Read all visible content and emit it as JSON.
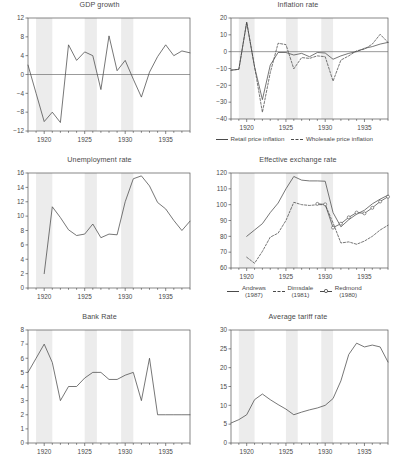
{
  "figure": {
    "width": 397,
    "height": 467,
    "background": "#ffffff",
    "band_color": "#ececec",
    "line_color": "#4a4a4a"
  },
  "chart_data": [
    {
      "id": "gdp-growth",
      "type": "line",
      "title": "GDP growth",
      "xlabel": "",
      "ylabel": "",
      "xlim": [
        1918,
        1938
      ],
      "ylim": [
        -12,
        12
      ],
      "yticks": [
        -12,
        -8,
        -4,
        0,
        4,
        8,
        12
      ],
      "xticks": [
        1920,
        1925,
        1930,
        1935
      ],
      "grid": false,
      "zero_line": true,
      "shaded_bands": [
        [
          1919,
          1921
        ],
        [
          1925,
          1926.5
        ],
        [
          1929.5,
          1931
        ]
      ],
      "x": [
        1918,
        1919,
        1920,
        1921,
        1922,
        1923,
        1924,
        1925,
        1926,
        1927,
        1928,
        1929,
        1930,
        1931,
        1932,
        1933,
        1934,
        1935,
        1936,
        1937,
        1938
      ],
      "series": [
        {
          "name": "GDP growth",
          "style": "solid",
          "values": [
            2.0,
            -4.0,
            -10.0,
            -8.0,
            -10.2,
            6.3,
            3.0,
            4.8,
            4.0,
            -3.2,
            8.2,
            0.8,
            3.0,
            -1.0,
            -4.8,
            0.5,
            3.8,
            6.3,
            4.0,
            5.0,
            4.6,
            1.0
          ]
        }
      ]
    },
    {
      "id": "inflation-rate",
      "type": "line",
      "title": "Inflation rate",
      "xlabel": "",
      "ylabel": "",
      "xlim": [
        1918,
        1938
      ],
      "ylim": [
        -40,
        20
      ],
      "yticks": [
        -40,
        -30,
        -20,
        -10,
        0,
        10,
        20
      ],
      "xticks": [
        1920,
        1925,
        1930,
        1935
      ],
      "grid": false,
      "zero_line": true,
      "shaded_bands": [
        [
          1919,
          1921
        ],
        [
          1925,
          1926.5
        ],
        [
          1929.5,
          1931
        ]
      ],
      "legend_position": "below",
      "x": [
        1918,
        1919,
        1920,
        1921,
        1922,
        1923,
        1924,
        1925,
        1926,
        1927,
        1928,
        1929,
        1930,
        1931,
        1932,
        1933,
        1934,
        1935,
        1936,
        1937,
        1938
      ],
      "series": [
        {
          "name": "Retail price inflation",
          "style": "solid",
          "values": [
            -11.0,
            -10.5,
            17.5,
            -9.0,
            -28.5,
            -8.0,
            -0.5,
            -0.5,
            -2.0,
            -1.0,
            -3.0,
            -0.5,
            -0.8,
            -4.5,
            -2.5,
            -1.0,
            0.0,
            2.0,
            3.0,
            4.5,
            5.5,
            -1.5
          ]
        },
        {
          "name": "Wholesale price inflation",
          "style": "dashed",
          "values": [
            -11.0,
            -10.5,
            17.5,
            -9.0,
            -36.0,
            -12.5,
            5.0,
            4.2,
            -10.2,
            -3.5,
            -4.0,
            -2.5,
            -3.0,
            -17.5,
            -5.0,
            -2.5,
            0.5,
            1.5,
            4.5,
            10.3,
            5.5,
            -8.0
          ]
        }
      ]
    },
    {
      "id": "unemployment-rate",
      "type": "line",
      "title": "Unemployment rate",
      "xlabel": "",
      "ylabel": "",
      "xlim": [
        1918,
        1938
      ],
      "ylim": [
        0,
        16
      ],
      "yticks": [
        0,
        2,
        4,
        6,
        8,
        10,
        12,
        14,
        16
      ],
      "xticks": [
        1920,
        1925,
        1930,
        1935
      ],
      "grid": false,
      "zero_line": false,
      "shaded_bands": [
        [
          1919,
          1921
        ],
        [
          1925,
          1926.5
        ],
        [
          1929.5,
          1931
        ]
      ],
      "x": [
        1920,
        1921,
        1922,
        1923,
        1924,
        1925,
        1926,
        1927,
        1928,
        1929,
        1930,
        1931,
        1932,
        1933,
        1934,
        1935,
        1936,
        1937,
        1938
      ],
      "series": [
        {
          "name": "Unemployment rate",
          "style": "solid",
          "values": [
            2.0,
            11.3,
            9.8,
            8.1,
            7.3,
            7.5,
            8.9,
            7.0,
            7.5,
            7.4,
            12.0,
            15.2,
            15.6,
            14.2,
            11.9,
            11.0,
            9.4,
            8.0,
            9.3
          ]
        }
      ]
    },
    {
      "id": "effective-exchange-rate",
      "type": "line",
      "title": "Effective exchange rate",
      "xlabel": "",
      "ylabel": "",
      "xlim": [
        1918,
        1938
      ],
      "ylim": [
        60,
        120
      ],
      "yticks": [
        60,
        70,
        80,
        90,
        100,
        110,
        120
      ],
      "xticks": [
        1920,
        1925,
        1930,
        1935
      ],
      "grid": false,
      "zero_line": false,
      "shaded_bands": [
        [
          1919,
          1921
        ],
        [
          1925,
          1926.5
        ],
        [
          1929.5,
          1931
        ]
      ],
      "legend_position": "below",
      "x": [
        1920,
        1921,
        1922,
        1923,
        1924,
        1925,
        1926,
        1927,
        1928,
        1929,
        1930,
        1931,
        1932,
        1933,
        1934,
        1935,
        1936,
        1937,
        1938
      ],
      "series": [
        {
          "name": "Andrews (1987)",
          "legend_label": "Andrews",
          "legend_sub": "(1987)",
          "style": "solid",
          "values": [
            80.0,
            84.0,
            88.0,
            95.0,
            101.0,
            110.0,
            117.8,
            115.5,
            115.0,
            115.0,
            114.8,
            95.0,
            86.0,
            90.5,
            94.0,
            96.5,
            100.5,
            103.5,
            106.0
          ]
        },
        {
          "name": "Dimsdale (1981)",
          "legend_label": "Dimsdale",
          "legend_sub": "(1981)",
          "style": "dashed",
          "values": [
            66.8,
            63.0,
            70.5,
            79.5,
            82.0,
            90.0,
            101.5,
            100.0,
            99.5,
            100.0,
            100.0,
            88.5,
            75.8,
            76.5,
            75.0,
            77.0,
            80.0,
            84.0,
            87.0
          ]
        },
        {
          "name": "Redmond (1980)",
          "legend_label": "Redmond",
          "legend_sub": "(1980)",
          "style": "solid-marker",
          "values": [
            null,
            null,
            null,
            null,
            null,
            null,
            null,
            null,
            null,
            100.5,
            100.2,
            85.5,
            88.0,
            92.0,
            95.0,
            94.5,
            98.0,
            102.0,
            105.0
          ]
        }
      ]
    },
    {
      "id": "bank-rate",
      "type": "line",
      "title": "Bank Rate",
      "xlabel": "",
      "ylabel": "",
      "xlim": [
        1918,
        1938
      ],
      "ylim": [
        0,
        8
      ],
      "yticks": [
        0,
        1,
        2,
        3,
        4,
        5,
        6,
        7,
        8
      ],
      "xticks": [
        1920,
        1925,
        1930,
        1935
      ],
      "grid": false,
      "zero_line": false,
      "shaded_bands": [
        [
          1919,
          1921
        ],
        [
          1925,
          1926.5
        ],
        [
          1929.5,
          1931
        ]
      ],
      "x": [
        1918,
        1919,
        1920,
        1921,
        1922,
        1923,
        1924,
        1925,
        1926,
        1927,
        1928,
        1929,
        1930,
        1931,
        1932,
        1933,
        1934,
        1935,
        1936,
        1937,
        1938
      ],
      "series": [
        {
          "name": "Bank Rate",
          "style": "solid",
          "values": [
            5.0,
            6.0,
            7.0,
            5.7,
            3.0,
            4.0,
            4.0,
            4.6,
            5.0,
            5.0,
            4.5,
            4.5,
            4.8,
            5.0,
            3.0,
            6.0,
            2.0,
            2.0,
            2.0,
            2.0,
            2.0,
            2.1
          ]
        }
      ]
    },
    {
      "id": "average-tariff-rate",
      "type": "line",
      "title": "Average tariff rate",
      "xlabel": "",
      "ylabel": "",
      "xlim": [
        1918,
        1938
      ],
      "ylim": [
        0,
        30
      ],
      "yticks": [
        0,
        5,
        10,
        15,
        20,
        25,
        30
      ],
      "xticks": [
        1920,
        1925,
        1930,
        1935
      ],
      "grid": false,
      "zero_line": false,
      "shaded_bands": [
        [
          1919,
          1921
        ],
        [
          1925,
          1926.5
        ],
        [
          1929.5,
          1931
        ]
      ],
      "x": [
        1918,
        1919,
        1920,
        1921,
        1922,
        1923,
        1924,
        1925,
        1926,
        1927,
        1928,
        1929,
        1930,
        1931,
        1932,
        1933,
        1934,
        1935,
        1936,
        1937,
        1938
      ],
      "series": [
        {
          "name": "Average tariff rate",
          "style": "solid",
          "values": [
            5.3,
            6.2,
            7.5,
            11.5,
            13.0,
            11.5,
            10.2,
            9.0,
            7.5,
            8.2,
            8.8,
            9.3,
            10.0,
            11.8,
            16.5,
            23.5,
            26.5,
            25.5,
            26.0,
            25.5,
            21.5,
            25.0
          ]
        }
      ]
    }
  ]
}
